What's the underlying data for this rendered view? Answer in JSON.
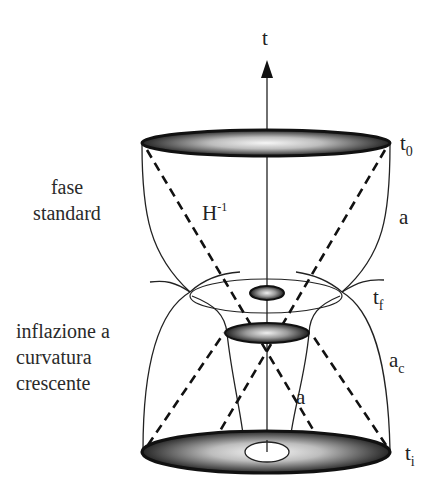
{
  "diagram": {
    "axis_label": "t",
    "labels": {
      "t0": {
        "base": "t",
        "sub": "0"
      },
      "tf": {
        "base": "t",
        "sub": "f"
      },
      "ti": {
        "base": "t",
        "sub": "i"
      },
      "a_upper": "a",
      "a_inner": "a",
      "ac": {
        "base": "a",
        "sub": "c"
      },
      "hubble": {
        "base": "H",
        "sup": "-1"
      }
    },
    "phases": {
      "standard": [
        "fase",
        "standard"
      ],
      "inflation": [
        "inflazione a",
        "curvatura",
        "crescente"
      ]
    },
    "colors": {
      "ink": "#222222",
      "disk_dark": "#2b2b2b",
      "disk_light": "#f4f4f4"
    }
  }
}
